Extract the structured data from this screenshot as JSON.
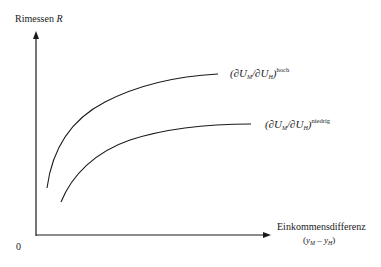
{
  "diagram": {
    "y_axis": {
      "label": "Rimessen",
      "symbol": "R"
    },
    "x_axis": {
      "label": "Einkommensdifferenz",
      "sublabel_open": "(",
      "var_a": "y",
      "sub_a": "M",
      "minus": " – ",
      "var_b": "y",
      "sub_b": "H",
      "sublabel_close": ")"
    },
    "origin": "0",
    "curves": [
      {
        "name": "hoch",
        "open": "(∂",
        "u1": "U",
        "s1": "M",
        "slash": "/∂",
        "u2": "U",
        "s2": "H",
        "close": ")",
        "superscript": "hoch"
      },
      {
        "name": "niedrig",
        "open": "(∂",
        "u1": "U",
        "s1": "M",
        "slash": "/∂",
        "u2": "U",
        "s2": "H",
        "close": ")",
        "superscript": "niedrig"
      }
    ],
    "colors": {
      "line": "#1a1a1a",
      "background": "#ffffff"
    }
  }
}
